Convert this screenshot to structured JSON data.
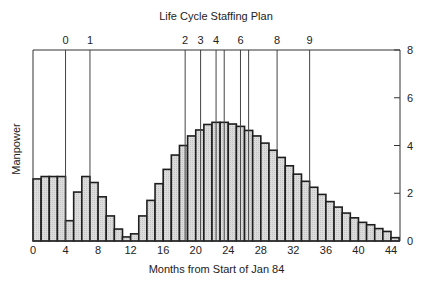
{
  "chart_data": {
    "type": "bar",
    "title": "Life Cycle Staffing Plan",
    "xlabel": "Months from Start of Jan 84",
    "ylabel": "Manpower",
    "xlim": [
      0,
      45
    ],
    "ylim": [
      0,
      8
    ],
    "grid": false,
    "legend": null,
    "x_ticks": [
      0,
      4,
      8,
      12,
      16,
      20,
      24,
      28,
      32,
      36,
      40,
      44
    ],
    "y_ticks": [
      0,
      2,
      4,
      6,
      8
    ],
    "y_axis_position": "right",
    "bar_width_months": 1,
    "categories": [
      0,
      1,
      2,
      3,
      4,
      5,
      6,
      7,
      8,
      9,
      10,
      11,
      12,
      13,
      14,
      15,
      16,
      17,
      18,
      19,
      20,
      21,
      22,
      23,
      24,
      25,
      26,
      27,
      28,
      29,
      30,
      31,
      32,
      33,
      34,
      35,
      36,
      37,
      38,
      39,
      40,
      41,
      42,
      43,
      44
    ],
    "values": [
      2.6,
      2.7,
      2.7,
      2.7,
      0.85,
      2.05,
      2.7,
      2.45,
      1.85,
      1.05,
      0.5,
      0.17,
      0.3,
      1.05,
      1.7,
      2.4,
      3.0,
      3.6,
      4.0,
      4.4,
      4.65,
      4.88,
      4.97,
      4.97,
      4.9,
      4.8,
      4.63,
      4.4,
      4.1,
      3.8,
      3.5,
      3.15,
      2.8,
      2.5,
      2.25,
      1.95,
      1.65,
      1.42,
      1.17,
      0.97,
      0.78,
      0.68,
      0.52,
      0.4,
      0.14
    ],
    "milestones": [
      {
        "label": "0",
        "month": 4
      },
      {
        "label": "1",
        "month": 7
      },
      {
        "label": "2",
        "month": 18.7
      },
      {
        "label": "3",
        "month": 20.6
      },
      {
        "label": "4",
        "month": 22.5
      },
      {
        "label": "",
        "month": 23.5
      },
      {
        "label": "6",
        "month": 25.5
      },
      {
        "label": "",
        "month": 26.5
      },
      {
        "label": "8",
        "month": 30
      },
      {
        "label": "9",
        "month": 34
      }
    ],
    "colors": {
      "bar_fill": "#d6d6d6",
      "bar_stroke": "#1e1e1e",
      "axis": "#333333",
      "milestone_line": "#444444"
    }
  }
}
